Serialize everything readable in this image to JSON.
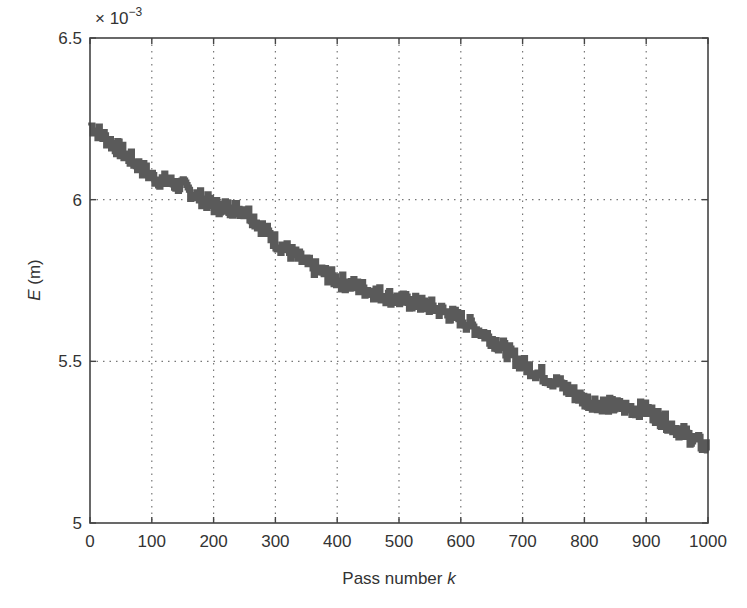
{
  "chart_data": {
    "type": "line",
    "title": "",
    "xlabel": "Pass number k",
    "xlabel_main": "Pass number ",
    "xlabel_italic": "k",
    "ylabel": "E (m)",
    "ylabel_italic": "E",
    "ylabel_main": " (m)",
    "y_multiplier": "× 10",
    "y_multiplier_exp": "−3",
    "xlim": [
      0,
      1000
    ],
    "ylim": [
      5.0,
      6.5
    ],
    "y_scale": 0.001,
    "grid": true,
    "legend": null,
    "x_ticks": [
      0,
      100,
      200,
      300,
      400,
      500,
      600,
      700,
      800,
      900,
      1000
    ],
    "y_ticks": [
      5,
      5.5,
      6,
      6.5
    ],
    "y_tick_labels": [
      "5",
      "5.5",
      "6",
      "6.5"
    ],
    "series": [
      {
        "name": "E",
        "color": "#5a5a5a",
        "x": [
          0,
          50,
          100,
          150,
          200,
          250,
          300,
          350,
          400,
          450,
          500,
          550,
          600,
          650,
          700,
          750,
          800,
          850,
          900,
          950,
          1000
        ],
        "values": [
          6.23,
          6.15,
          6.07,
          6.04,
          5.98,
          5.97,
          5.87,
          5.8,
          5.75,
          5.72,
          5.69,
          5.67,
          5.63,
          5.57,
          5.49,
          5.44,
          5.38,
          5.36,
          5.35,
          5.29,
          5.23
        ]
      }
    ]
  }
}
